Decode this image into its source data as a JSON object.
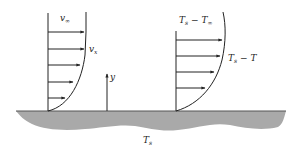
{
  "diagram": {
    "colors": {
      "stroke": "#222222",
      "surface_fill": "#a9a9a9",
      "background": "#ffffff"
    },
    "velocity_profile": {
      "free_stream_label": {
        "main": "v",
        "sub": "∞"
      },
      "local_label": {
        "main": "v",
        "sub": "x"
      },
      "arrow_count": 5
    },
    "axis": {
      "label": "y"
    },
    "thermal_profile": {
      "free_stream_label": {
        "main1": "T",
        "sub1": "s",
        "op": " − ",
        "main2": "T",
        "sub2": "∞"
      },
      "local_label": {
        "main1": "T",
        "sub1": "s",
        "op": " − ",
        "main2": "T"
      },
      "arrow_count": 4
    },
    "surface": {
      "label": {
        "main": "T",
        "sub": "s"
      }
    }
  }
}
